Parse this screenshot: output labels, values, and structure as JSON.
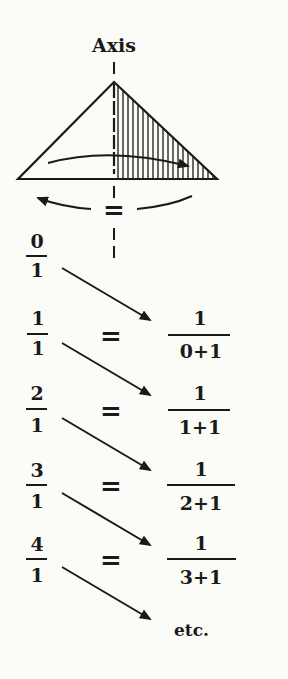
{
  "diagram": {
    "axis_label": "Axis",
    "rotation_symbol": "=",
    "rows": [
      {
        "left_num": "0",
        "left_den": "1",
        "equals": "",
        "right_num": "",
        "right_den": ""
      },
      {
        "left_num": "1",
        "left_den": "1",
        "equals": "=",
        "right_num": "1",
        "right_den": "0+1"
      },
      {
        "left_num": "2",
        "left_den": "1",
        "equals": "=",
        "right_num": "1",
        "right_den": "1+1"
      },
      {
        "left_num": "3",
        "left_den": "1",
        "equals": "=",
        "right_num": "1",
        "right_den": "2+1"
      },
      {
        "left_num": "4",
        "left_den": "1",
        "equals": "=",
        "right_num": "1",
        "right_den": "3+1"
      }
    ],
    "final_label": "etc.",
    "colors": {
      "ink": "#1a1a1a",
      "background": "#fbfbf8"
    }
  }
}
